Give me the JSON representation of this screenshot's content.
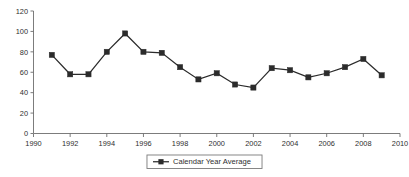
{
  "chart_data": {
    "type": "line",
    "title": "",
    "subtitle": "",
    "xlabel": "",
    "ylabel": "",
    "xlim": [
      1990,
      2010
    ],
    "ylim": [
      0,
      120
    ],
    "grid": false,
    "legend_position": "bottom-center",
    "x_ticks": [
      1990,
      1992,
      1994,
      1996,
      1998,
      2000,
      2002,
      2004,
      2006,
      2008,
      2010
    ],
    "y_ticks": [
      0,
      20,
      40,
      60,
      80,
      100,
      120
    ],
    "x": [
      1991,
      1992,
      1993,
      1994,
      1995,
      1996,
      1997,
      1998,
      1999,
      2000,
      2001,
      2002,
      2003,
      2004,
      2005,
      2006,
      2007,
      2008,
      2009
    ],
    "series": [
      {
        "name": "Calendar Year Average",
        "color": "#2b2b2b",
        "marker": "square",
        "values": [
          77,
          58,
          58,
          80,
          98,
          80,
          79,
          65,
          53,
          59,
          48,
          45,
          64,
          62,
          55,
          59,
          65,
          73,
          57
        ]
      }
    ]
  },
  "legend": {
    "entries": [
      {
        "label": "Calendar Year Average",
        "marker_icon": "line-square-marker-icon"
      }
    ]
  },
  "axes": {
    "y_tick_labels": [
      "0",
      "20",
      "40",
      "60",
      "80",
      "100",
      "120"
    ],
    "x_tick_labels": [
      "1990",
      "1992",
      "1994",
      "1996",
      "1998",
      "2000",
      "2002",
      "2004",
      "2006",
      "2008",
      "2010"
    ]
  }
}
